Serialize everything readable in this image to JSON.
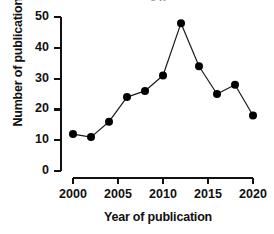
{
  "figure": {
    "title_fragment": "y g",
    "background_color": "#ffffff",
    "marker_color": "#000000",
    "line_color": "#1a1a1a",
    "axis_color": "#111111"
  },
  "chart_data": {
    "type": "line",
    "title": "",
    "xlabel": "Year of publication",
    "ylabel": "Number of publications",
    "x": [
      2000,
      2002,
      2004,
      2006,
      2008,
      2010,
      2012,
      2014,
      2016,
      2018,
      2020
    ],
    "values": [
      12,
      11,
      16,
      24,
      26,
      31,
      48,
      34,
      25,
      28,
      18
    ],
    "series": [
      {
        "name": "Publications",
        "values": [
          12,
          11,
          16,
          24,
          26,
          31,
          48,
          34,
          25,
          28,
          18
        ]
      }
    ],
    "xlim": [
      2000,
      2020
    ],
    "ylim": [
      0,
      50
    ],
    "xticks": [
      2000,
      2005,
      2010,
      2015,
      2020
    ],
    "xtick_labels": [
      "2000",
      "2005",
      "2010",
      "2015",
      "2020"
    ],
    "yticks": [
      0,
      10,
      20,
      30,
      40,
      50
    ],
    "ytick_labels": [
      "0",
      "10",
      "20",
      "30",
      "40",
      "50"
    ],
    "grid": false,
    "legend": false,
    "legend_position": "none",
    "marker": "circle",
    "annotations": []
  }
}
